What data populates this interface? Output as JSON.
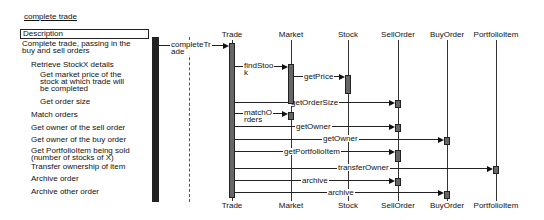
{
  "title": "complete trade",
  "description_header": "Description",
  "descriptions": [
    {
      "text": "Complete trade, passing in the\nbuy and sell orders",
      "x": 22,
      "y": 40
    },
    {
      "text": "Retrieve StockX details",
      "x": 31,
      "y": 61
    },
    {
      "text": "Get market price of the\nstock at which trade will\nbe completed",
      "x": 40,
      "y": 71
    },
    {
      "text": "Get order size",
      "x": 40,
      "y": 98
    },
    {
      "text": "Match orders",
      "x": 31,
      "y": 111
    },
    {
      "text": "Get owner of the sell order",
      "x": 31,
      "y": 124
    },
    {
      "text": "Get owner of the buy order",
      "x": 31,
      "y": 136
    },
    {
      "text": "Get PortfolioItem being sold\n(number of stocks of X)",
      "x": 31,
      "y": 147
    },
    {
      "text": "Transfer ownership of item",
      "x": 31,
      "y": 163
    },
    {
      "text": "Archive order",
      "x": 31,
      "y": 175
    },
    {
      "text": "Archive other order",
      "x": 31,
      "y": 188
    }
  ],
  "lifelines": [
    {
      "name": "Trade",
      "x": 232
    },
    {
      "name": "Market",
      "x": 291
    },
    {
      "name": "Stock",
      "x": 348
    },
    {
      "name": "SellOrder",
      "x": 398
    },
    {
      "name": "BuyOrder",
      "x": 447
    },
    {
      "name": "PortfolioItem",
      "x": 496
    }
  ],
  "messages": [
    {
      "label": "completeTr\nade",
      "from_x": 155,
      "to_x": 229,
      "y": 45,
      "label_x": 170,
      "label_y": 41
    },
    {
      "label": "findStoo\nk",
      "from_x": 235,
      "to_x": 288,
      "y": 66,
      "label_x": 243,
      "label_y": 62
    },
    {
      "label": "getPrice",
      "from_x": 294,
      "to_x": 345,
      "y": 76,
      "label_x": 303,
      "label_y": 73
    },
    {
      "label": "getOrderSize",
      "from_x": 235,
      "to_x": 395,
      "y": 102,
      "label_x": 290,
      "label_y": 99
    },
    {
      "label": "matchO\nrders",
      "from_x": 235,
      "to_x": 288,
      "y": 113,
      "label_x": 243,
      "label_y": 109
    },
    {
      "label": "getOwner",
      "from_x": 235,
      "to_x": 395,
      "y": 126,
      "label_x": 295,
      "label_y": 123
    },
    {
      "label": "getOwner",
      "from_x": 235,
      "to_x": 444,
      "y": 139,
      "label_x": 322,
      "label_y": 135
    },
    {
      "label": "getPortfolioItem",
      "from_x": 235,
      "to_x": 395,
      "y": 151,
      "label_x": 283,
      "label_y": 148
    },
    {
      "label": "transferOwner",
      "from_x": 235,
      "to_x": 493,
      "y": 168,
      "label_x": 337,
      "label_y": 164
    },
    {
      "label": "archive",
      "from_x": 235,
      "to_x": 395,
      "y": 180,
      "label_x": 301,
      "label_y": 177
    },
    {
      "label": "archive",
      "from_x": 235,
      "to_x": 444,
      "y": 192,
      "label_x": 327,
      "label_y": 189
    }
  ]
}
